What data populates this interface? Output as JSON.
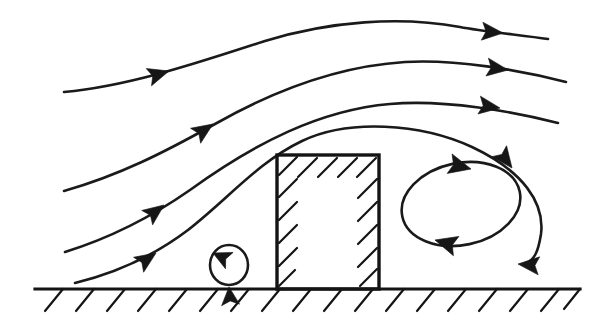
{
  "figure": {
    "caption": "",
    "background_color": "#ffffff",
    "ink_color": "#141414",
    "width": 608,
    "height": 322
  },
  "chart_data": {
    "type": "diagram",
    "subtype": "streamline-flow-schematic",
    "flow_direction": "left-to-right",
    "xlabel": "",
    "ylabel": "",
    "grid": false,
    "legend": false,
    "elements": {
      "ground": {
        "name": "ground-surface",
        "y": 289,
        "x_start": 35,
        "x_end": 580,
        "hatch_count": 18,
        "hatch_direction": "down-left",
        "hatch_length": 24
      },
      "building": {
        "name": "building",
        "x": 277,
        "y": 155,
        "width": 102,
        "height": 134,
        "hatched_edges": [
          "top",
          "left",
          "right"
        ],
        "hatch_direction": "up-right",
        "hatch_length": 22
      },
      "streamlines": [
        {
          "id": 1,
          "label": "upper-streamline",
          "path": "M 64 92 C 130 86 200 62 265 41 C 330 21 400 16 460 27 C 478 30 492 32 500 33",
          "end_x": 548,
          "arrow_positions": [
            {
              "x": 165,
              "y": 73,
              "angle": -17
            },
            {
              "x": 497,
              "y": 32,
              "angle": 4
            }
          ]
        },
        {
          "id": 2,
          "label": "second-streamline",
          "path": "M 64 191 C 120 175 165 152 215 124 C 275 90 340 66 405 62 C 450 60 485 65 503 69",
          "end_x": 566,
          "arrow_positions": [
            {
              "x": 209,
              "y": 127,
              "angle": -34
            },
            {
              "x": 502,
              "y": 70,
              "angle": 7
            }
          ]
        },
        {
          "id": 3,
          "label": "third-streamline",
          "path": "M 65 252 C 110 238 150 218 190 190 C 255 143 320 110 390 104 C 440 100 478 104 494 107",
          "end_x": 558,
          "arrow_positions": [
            {
              "x": 160,
              "y": 208,
              "angle": -37
            },
            {
              "x": 494,
              "y": 107,
              "angle": 6
            }
          ]
        },
        {
          "id": 4,
          "label": "lowest-streamline-wake",
          "path": "M 75 283 C 120 272 155 255 188 230 C 230 198 262 160 305 140 C 350 120 420 124 470 145 C 520 168 540 200 537 232 C 535 250 530 258 524 262",
          "end_x": 524,
          "arrow_positions": [
            {
              "x": 152,
              "y": 256,
              "angle": -33
            },
            {
              "x": 508,
              "y": 163,
              "angle": 52
            },
            {
              "x": 543,
              "y": 262,
              "angle": 186
            }
          ]
        }
      ],
      "vortices": [
        {
          "id": "upstream-vortex",
          "label": "windward-base-vortex",
          "shape": "circle",
          "cx": 229,
          "cy": 265,
          "rx": 19,
          "ry": 20,
          "rotation": "counterclockwise",
          "arrow_positions": [
            {
              "x": 221,
              "y": 249,
              "angle": 200
            },
            {
              "x": 233,
              "y": 283,
              "angle": 250
            }
          ]
        },
        {
          "id": "lee-eddy",
          "label": "lee-recirculation-eddy",
          "shape": "ellipse",
          "cx": 461,
          "cy": 204,
          "rx": 60,
          "ry": 41,
          "tilt_deg": -12,
          "rotation": "clockwise",
          "arrow_positions": [
            {
              "x": 468,
              "y": 170,
              "angle": 14
            },
            {
              "x": 441,
              "y": 238,
              "angle": 196
            }
          ]
        }
      ]
    },
    "annotations": []
  }
}
